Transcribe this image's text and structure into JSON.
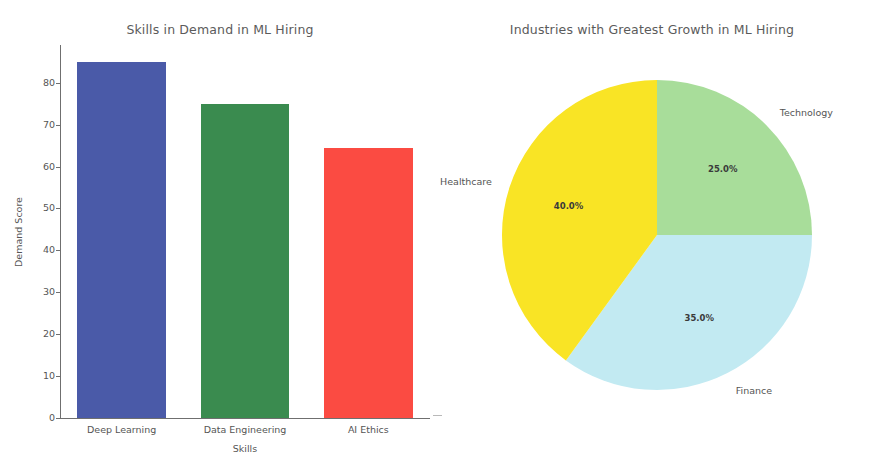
{
  "figure": {
    "background": "#ffffff",
    "width": 872,
    "height": 464
  },
  "chart_data": [
    {
      "type": "bar",
      "title": "Skills in Demand in ML Hiring",
      "xlabel": "Skills",
      "ylabel": "Demand Score",
      "categories": [
        "Deep Learning",
        "Data Engineering",
        "AI Ethics"
      ],
      "values": [
        85,
        75,
        64.5
      ],
      "colors": [
        "#4a5aa8",
        "#3a8b4f",
        "#fb4b42"
      ],
      "ylim": [
        0,
        89
      ],
      "yticks": [
        0,
        10,
        20,
        30,
        40,
        50,
        60,
        70,
        80
      ],
      "ytick_labels": [
        "0",
        "10",
        "20",
        "30",
        "40",
        "50",
        "60",
        "70",
        "80"
      ],
      "grid": false,
      "legend": "none"
    },
    {
      "type": "pie",
      "title": "Industries with Greatest Growth in ML Hiring",
      "labels": [
        "Technology",
        "Finance",
        "Healthcare"
      ],
      "values": [
        25.0,
        35.0,
        40.0
      ],
      "pct_labels": [
        "25.0%",
        "35.0%",
        "40.0%"
      ],
      "colors": [
        "#a8dd9a",
        "#c2eaf2",
        "#f9e425"
      ],
      "startangle": 90,
      "direction": "clockwise",
      "legend": "none",
      "label_positions": [
        "top",
        "right",
        "left"
      ]
    }
  ],
  "bar_chart": {
    "title": "Skills in Demand in ML Hiring",
    "xlabel": "Skills",
    "ylabel": "Demand Score",
    "yticks": [
      {
        "label": "80",
        "value": 80
      },
      {
        "label": "70",
        "value": 70
      },
      {
        "label": "60",
        "value": 60
      },
      {
        "label": "50",
        "value": 50
      },
      {
        "label": "40",
        "value": 40
      },
      {
        "label": "30",
        "value": 30
      },
      {
        "label": "20",
        "value": 20
      },
      {
        "label": "10",
        "value": 10
      },
      {
        "label": "0",
        "value": 0
      }
    ],
    "bars": [
      {
        "label": "Deep Learning",
        "value": 85,
        "color": "#4a5aa8"
      },
      {
        "label": "Data Engineering",
        "value": 75,
        "color": "#3a8b4f"
      },
      {
        "label": "AI Ethics",
        "value": 64.5,
        "color": "#fb4b42"
      }
    ]
  },
  "pie_chart": {
    "title": "Industries with Greatest Growth in ML Hiring",
    "slices": [
      {
        "label": "Technology",
        "pct_label": "25.0%",
        "value": 25.0,
        "color": "#a8dd9a"
      },
      {
        "label": "Finance",
        "pct_label": "35.0%",
        "value": 35.0,
        "color": "#c2eaf2"
      },
      {
        "label": "Healthcare",
        "pct_label": "40.0%",
        "value": 40.0,
        "color": "#f9e425"
      }
    ]
  }
}
